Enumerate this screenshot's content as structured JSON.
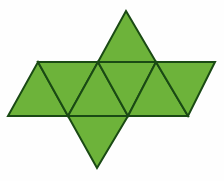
{
  "figure": {
    "name": "octahedron-net",
    "title": "Net of an octahedron",
    "shape_type": "polyhedron-net",
    "face_shape": "equilateral-triangle",
    "face_count": 8,
    "background_color": "#fefefe",
    "fill_color": "#6DB33A",
    "stroke_color": "#1a4a14",
    "stroke_width": 2,
    "canvas": {
      "width": 224,
      "height": 181
    },
    "geometry": {
      "band_top_y": 62,
      "band_bottom_y": 116,
      "band_top_left_x": 38,
      "band_top_right_x": 215,
      "band_bottom_left_x": 8,
      "band_bottom_right_x": 188,
      "top_apex": [
        126,
        11
      ],
      "bottom_apex": [
        97,
        168
      ],
      "triangle_side": 60
    },
    "faces": [
      {
        "id": "face-1",
        "label": "strip-triangle-up-left",
        "orientation": "up",
        "points": "8,116 68,116 38,62"
      },
      {
        "id": "face-2",
        "label": "strip-triangle-down-left",
        "orientation": "down",
        "points": "38,62 98,62 68,116"
      },
      {
        "id": "face-3",
        "label": "strip-triangle-up-center-left",
        "orientation": "up",
        "points": "68,116 128,116 98,62"
      },
      {
        "id": "face-4",
        "label": "strip-triangle-down-center-right",
        "orientation": "down",
        "points": "98,62 156,62 128,116"
      },
      {
        "id": "face-5",
        "label": "strip-triangle-up-right",
        "orientation": "up",
        "points": "128,116 188,116 156,62"
      },
      {
        "id": "face-6",
        "label": "strip-triangle-down-far-right",
        "orientation": "down",
        "points": "156,62 215,62 188,116"
      },
      {
        "id": "face-7",
        "label": "top-flap-triangle",
        "orientation": "up",
        "points": "98,62 156,62 126,11"
      },
      {
        "id": "face-8",
        "label": "bottom-flap-triangle",
        "orientation": "down",
        "points": "68,116 128,116 97,168"
      }
    ]
  }
}
